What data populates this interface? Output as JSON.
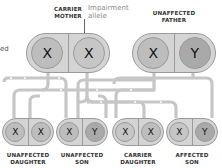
{
  "colors": {
    "background": "#ffffff",
    "capsule_fill": "#d4d4d4",
    "capsule_border": "#9a9a9a",
    "chromosome_normal": "#bdbdbd",
    "chromosome_affected": "#a3a3a3",
    "chromosome_light": "#d0d0d0",
    "connector": "#c4c4c4",
    "label_text": "#333333",
    "note_text": "#8a8a8a"
  },
  "left_fragment": "ed",
  "annotation": {
    "line1": "Impairment",
    "line2": "allele"
  },
  "parents": [
    {
      "label_line1": "CARRIER",
      "label_line2": "MOTHER",
      "chromosomes": [
        "X",
        "X"
      ]
    },
    {
      "label_line1": "UNAFFECTED",
      "label_line2": "FATHER",
      "chromosomes": [
        "X",
        "Y"
      ]
    }
  ],
  "children": [
    {
      "label_line1": "UNAFFECTED",
      "label_line2": "DAUGHTER",
      "chromosomes": [
        "X",
        "X"
      ]
    },
    {
      "label_line1": "UNAFFECTED",
      "label_line2": "SON",
      "chromosomes": [
        "X",
        "Y"
      ]
    },
    {
      "label_line1": "CARRIER",
      "label_line2": "DAUGHTER",
      "chromosomes": [
        "X",
        "X"
      ]
    },
    {
      "label_line1": "AFFECTED",
      "label_line2": "SON",
      "chromosomes": [
        "X",
        "Y"
      ]
    }
  ]
}
